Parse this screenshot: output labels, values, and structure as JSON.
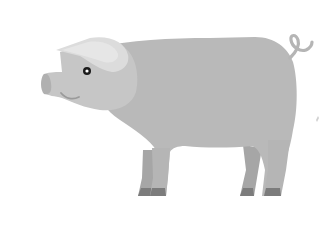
{
  "image": {
    "subject": "pig",
    "description": "Flat illustration of a gray pig standing, facing left, with a curly tail",
    "colors": {
      "background": "#ffffff",
      "body": "#b9b9b9",
      "head_light": "#c6c6c6",
      "ear": "#dcdcdc",
      "ear_inner": "#e4e4e4",
      "far_legs": "#a6a6a6",
      "hooves": "#7c7c7c",
      "eye": "#1a1a1a",
      "snout": "#c2c2c2",
      "mouth": "#9a9a9a",
      "tail": "#b5b5b5"
    }
  }
}
